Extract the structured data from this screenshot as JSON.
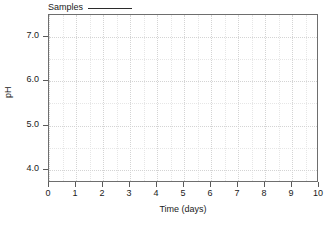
{
  "chart_data": {
    "type": "line",
    "title": "",
    "xlabel": "Time (days)",
    "ylabel": "pH",
    "xlim": [
      0,
      10
    ],
    "ylim": [
      3.7,
      7.5
    ],
    "grid": true,
    "legend_position": "above-plot-left",
    "x_ticks": [
      0,
      1,
      2,
      3,
      4,
      5,
      6,
      7,
      8,
      9,
      10
    ],
    "x_ticklabels": [
      "0",
      "1",
      "2",
      "3",
      "4",
      "5",
      "6",
      "7",
      "8",
      "9",
      "10"
    ],
    "y_ticks": [
      4.0,
      5.0,
      6.0,
      7.0
    ],
    "y_ticklabels": [
      "4.0",
      "5.0",
      "6.0",
      "7.0"
    ],
    "series": [
      {
        "name": "Samples",
        "style": "solid-line",
        "color": "#2b2b2b",
        "x": [],
        "values": []
      }
    ],
    "annotations": []
  },
  "legend": {
    "label": "Samples"
  },
  "axes": {
    "x_title": "Time (days)",
    "y_title": "pH"
  },
  "colors": {
    "frame": "#6e6e6e",
    "grid_major": "#d4d4d4",
    "grid_minor": "#e6e6e6",
    "tick": "#5a5a5a",
    "text": "#1a1a1a",
    "series": "#2b2b2b",
    "background": "#ffffff"
  }
}
